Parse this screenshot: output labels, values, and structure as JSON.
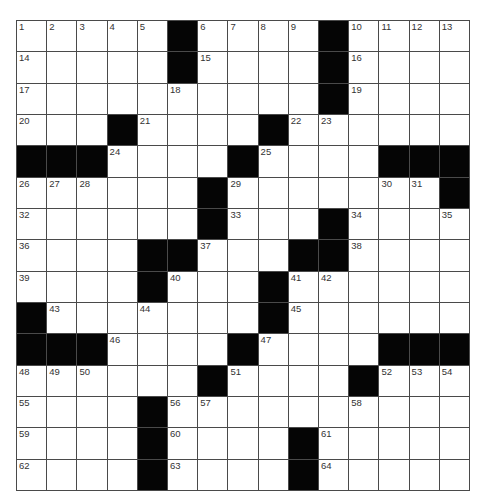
{
  "puzzle": {
    "rows": 15,
    "cols": 15,
    "colors": {
      "black_square": "#050505",
      "white_square": "#ffffff",
      "grid_line": "#4a4a4a",
      "number_text": "#333333"
    },
    "layout": [
      "....#....#....",
      "x"
    ],
    "grid": [
      [
        1,
        2,
        3,
        4,
        5,
        "#",
        6,
        7,
        8,
        9,
        "#",
        10,
        11,
        12,
        13
      ],
      [
        14,
        0,
        0,
        0,
        0,
        "#",
        15,
        0,
        0,
        0,
        "#",
        16,
        0,
        0,
        0
      ],
      [
        17,
        0,
        0,
        0,
        0,
        18,
        0,
        0,
        0,
        0,
        "#",
        19,
        0,
        0,
        0
      ],
      [
        20,
        0,
        0,
        "#",
        21,
        0,
        0,
        0,
        "#",
        22,
        23,
        0,
        0,
        0,
        0
      ],
      [
        "#",
        "#",
        "#",
        24,
        0,
        0,
        0,
        "#",
        25,
        0,
        0,
        0,
        "#",
        "#",
        "#"
      ],
      [
        26,
        27,
        28,
        0,
        0,
        0,
        "#",
        29,
        0,
        0,
        0,
        0,
        30,
        31,
        "#"
      ],
      [
        32,
        0,
        0,
        0,
        0,
        0,
        "#",
        33,
        0,
        0,
        "#",
        34,
        0,
        0,
        35
      ],
      [
        36,
        0,
        0,
        0,
        "#",
        "#",
        37,
        0,
        0,
        "#",
        "#",
        38,
        0,
        0,
        0
      ],
      [
        39,
        0,
        0,
        0,
        "#",
        40,
        0,
        0,
        "#",
        41,
        42,
        0,
        0,
        0,
        0
      ],
      [
        "#",
        43,
        0,
        0,
        44,
        0,
        0,
        0,
        "#",
        45,
        0,
        0,
        0,
        0,
        0
      ],
      [
        "#",
        "#",
        "#",
        46,
        0,
        0,
        0,
        "#",
        47,
        0,
        0,
        0,
        "#",
        "#",
        "#"
      ],
      [
        48,
        49,
        50,
        0,
        0,
        0,
        "#",
        51,
        0,
        0,
        0,
        "#",
        52,
        53,
        54
      ],
      [
        55,
        0,
        0,
        0,
        "#",
        56,
        57,
        0,
        0,
        0,
        0,
        58,
        0,
        0,
        0
      ],
      [
        59,
        0,
        0,
        0,
        "#",
        60,
        0,
        0,
        0,
        "#",
        61,
        0,
        0,
        0,
        0
      ],
      [
        62,
        0,
        0,
        0,
        "#",
        63,
        0,
        0,
        0,
        "#",
        64,
        0,
        0,
        0,
        0
      ]
    ],
    "entries": {}
  }
}
